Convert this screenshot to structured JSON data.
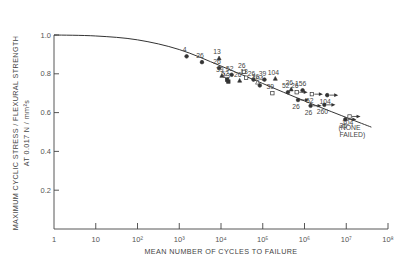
{
  "chart_data": {
    "type": "scatter",
    "title": "",
    "xlabel": "MEAN NUMBER OF CYCLES TO FAILURE",
    "ylabel_line1": "MAXIMUM CYCLIC STRESS / FLEXURAL STRENGTH",
    "ylabel_line2": "AT 0.017 N/mm²s",
    "xscale": "log",
    "xlim": [
      1,
      100000000
    ],
    "ylim": [
      0,
      1.0
    ],
    "grid": false,
    "legend": null,
    "x_ticks": [
      {
        "value": 1,
        "label": "1"
      },
      {
        "value": 10,
        "label": "10"
      },
      {
        "value": 100,
        "label": "10²"
      },
      {
        "value": 1000,
        "label": "10³"
      },
      {
        "value": 10000,
        "label": "10⁴"
      },
      {
        "value": 100000,
        "label": "10⁵"
      },
      {
        "value": 1000000,
        "label": "10⁶"
      },
      {
        "value": 10000000,
        "label": "10⁷"
      },
      {
        "value": 100000000,
        "label": "10⁸"
      }
    ],
    "y_ticks": [
      {
        "value": 1.0,
        "label": "1.0"
      },
      {
        "value": 0.8,
        "label": "0.8"
      },
      {
        "value": 0.6,
        "label": "0.6"
      },
      {
        "value": 0.4,
        "label": "0.4"
      },
      {
        "value": 0.2,
        "label": "0.2"
      }
    ],
    "fit_curve": [
      {
        "x": 1,
        "y": 1.0
      },
      {
        "x": 10,
        "y": 0.995
      },
      {
        "x": 100,
        "y": 0.975
      },
      {
        "x": 1000,
        "y": 0.925
      },
      {
        "x": 10000,
        "y": 0.84
      },
      {
        "x": 100000,
        "y": 0.75
      },
      {
        "x": 1000000,
        "y": 0.66
      },
      {
        "x": 10000000,
        "y": 0.575
      },
      {
        "x": 40000000,
        "y": 0.525
      }
    ],
    "points": [
      {
        "x": 1500,
        "y": 0.89,
        "label": "4",
        "marker": "filled-circle"
      },
      {
        "x": 3500,
        "y": 0.86,
        "label": "26",
        "marker": "filled-circle"
      },
      {
        "x": 9000,
        "y": 0.88,
        "label": "13",
        "marker": "filled-triangle"
      },
      {
        "x": 9000,
        "y": 0.83,
        "label": "26",
        "marker": "filled-circle"
      },
      {
        "x": 18000,
        "y": 0.795,
        "label": "52",
        "marker": "filled-circle"
      },
      {
        "x": 10500,
        "y": 0.79,
        "label": "39",
        "marker": "filled-triangle"
      },
      {
        "x": 14000,
        "y": 0.77,
        "label": "52",
        "marker": "filled-square"
      },
      {
        "x": 15000,
        "y": 0.76,
        "label": "13",
        "marker": "filled-square"
      },
      {
        "x": 35000,
        "y": 0.81,
        "label": "26",
        "marker": "open-square"
      },
      {
        "x": 40000,
        "y": 0.78,
        "label": "13",
        "marker": "open-square"
      },
      {
        "x": 28000,
        "y": 0.765,
        "label": "26",
        "marker": "filled-triangle"
      },
      {
        "x": 60000,
        "y": 0.77,
        "label": "26",
        "marker": "filled-circle"
      },
      {
        "x": 75000,
        "y": 0.755,
        "label": "26",
        "marker": "open-triangle"
      },
      {
        "x": 110000,
        "y": 0.77,
        "label": "39",
        "marker": "filled-circle"
      },
      {
        "x": 200000,
        "y": 0.775,
        "label": "104",
        "marker": "filled-triangle"
      },
      {
        "x": 85000,
        "y": 0.74,
        "label": "104",
        "marker": "filled-circle"
      },
      {
        "x": 170000,
        "y": 0.7,
        "label": "39",
        "marker": "open-square"
      },
      {
        "x": 400000,
        "y": 0.705,
        "label": "52",
        "marker": "filled-circle"
      },
      {
        "x": 480000,
        "y": 0.72,
        "label": "26",
        "marker": "filled-triangle"
      },
      {
        "x": 650000,
        "y": 0.705,
        "label": "26",
        "marker": "open-square-arrow"
      },
      {
        "x": 900000,
        "y": 0.715,
        "label": "156",
        "marker": "filled-circle"
      },
      {
        "x": 1500000,
        "y": 0.695,
        "label": "52",
        "marker": "open-square-arrow"
      },
      {
        "x": 3500000,
        "y": 0.69,
        "label": "104",
        "marker": "filled-circle-arrow"
      },
      {
        "x": 700000,
        "y": 0.665,
        "label": "26",
        "marker": "filled-circle-arrow"
      },
      {
        "x": 1400000,
        "y": 0.635,
        "label": "26",
        "marker": "filled-circle-arrow"
      },
      {
        "x": 3000000,
        "y": 0.64,
        "label": "260",
        "marker": "filled-circle-arrow"
      },
      {
        "x": 12000000,
        "y": 0.58,
        "label": "104",
        "marker": "open-square-arrow"
      },
      {
        "x": 9500000,
        "y": 0.565,
        "label": "26",
        "marker": "filled-circle-arrow"
      }
    ],
    "annotations": [
      {
        "text": "(NONE",
        "x": 12000000,
        "y": 0.51
      },
      {
        "text": "FAILED)",
        "x": 14000000,
        "y": 0.475
      }
    ]
  },
  "axes": {
    "x_title": "MEAN NUMBER OF CYCLES TO FAILURE",
    "y_title_1": "MAXIMUM CYCLIC STRESS / FLEXURAL STRENGTH",
    "y_title_2": "AT 0.017 N / mm²s"
  },
  "colors": {
    "ink": "#333333",
    "background": "#ffffff"
  }
}
